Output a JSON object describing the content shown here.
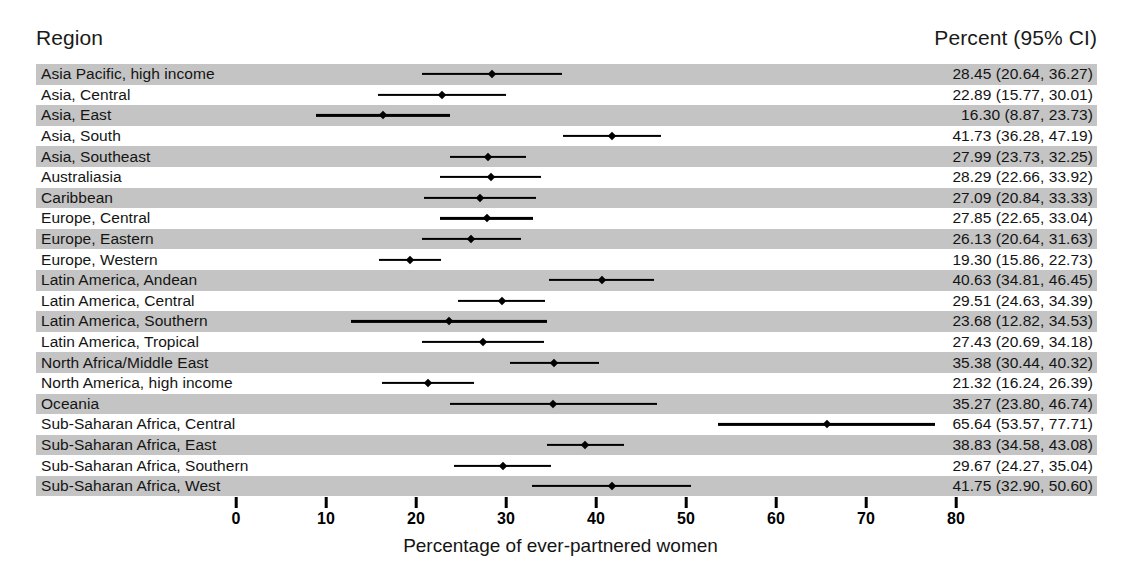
{
  "header": {
    "region_label": "Region",
    "percent_label": "Percent (95% CI)"
  },
  "axis": {
    "title": "Percentage of ever-partnered women",
    "ticks": [
      0,
      10,
      20,
      30,
      40,
      50,
      60,
      70,
      80
    ],
    "min": 0,
    "max": 80,
    "px_at_zero": 236,
    "px_per_unit": 9.0
  },
  "style": {
    "band_color": "#c4c4c4",
    "line_color": "#000000",
    "background": "#ffffff"
  },
  "chart_data": {
    "type": "forest",
    "title": "",
    "xlabel": "Percentage of ever-partnered women",
    "ylabel": "Region",
    "xlim": [
      0,
      80
    ],
    "grid": false,
    "legend": "none",
    "value_header": "Percent (95% CI)",
    "categories": [
      "Asia Pacific, high income",
      "Asia, Central",
      "Asia, East",
      "Asia, South",
      "Asia, Southeast",
      "Australiasia",
      "Caribbean",
      "Europe, Central",
      "Europe, Eastern",
      "Europe, Western",
      "Latin America, Andean",
      "Latin America, Central",
      "Latin America, Southern",
      "Latin America, Tropical",
      "North Africa/Middle East",
      "North America, high income",
      "Oceania",
      "Sub-Saharan Africa, Central",
      "Sub-Saharan Africa, East",
      "Sub-Saharan Africa, Southern",
      "Sub-Saharan Africa, West"
    ],
    "values": [
      28.45,
      22.89,
      16.3,
      41.73,
      27.99,
      28.29,
      27.09,
      27.85,
      26.13,
      19.3,
      40.63,
      29.51,
      23.68,
      27.43,
      35.38,
      21.32,
      35.27,
      65.64,
      38.83,
      29.67,
      41.75
    ],
    "ci_low": [
      20.64,
      15.77,
      8.87,
      36.28,
      23.73,
      22.66,
      20.84,
      22.65,
      20.64,
      15.86,
      34.81,
      24.63,
      12.82,
      20.69,
      30.44,
      16.24,
      23.8,
      53.57,
      34.58,
      24.27,
      32.9
    ],
    "ci_high": [
      36.27,
      30.01,
      23.73,
      47.19,
      32.25,
      33.92,
      33.33,
      33.04,
      31.63,
      22.73,
      46.45,
      34.39,
      34.53,
      34.18,
      40.32,
      26.39,
      46.74,
      77.71,
      43.08,
      35.04,
      50.6
    ]
  },
  "rows": [
    {
      "region": "Asia Pacific, high income",
      "value_text": "28.45 (20.64, 36.27)",
      "est": 28.45,
      "low": 20.64,
      "high": 36.27,
      "banded": true
    },
    {
      "region": "Asia, Central",
      "value_text": "22.89 (15.77, 30.01)",
      "est": 22.89,
      "low": 15.77,
      "high": 30.01,
      "banded": false
    },
    {
      "region": "Asia, East",
      "value_text": "16.30 (8.87, 23.73)",
      "est": 16.3,
      "low": 8.87,
      "high": 23.73,
      "banded": true
    },
    {
      "region": "Asia, South",
      "value_text": "41.73 (36.28, 47.19)",
      "est": 41.73,
      "low": 36.28,
      "high": 47.19,
      "banded": false
    },
    {
      "region": "Asia, Southeast",
      "value_text": "27.99 (23.73, 32.25)",
      "est": 27.99,
      "low": 23.73,
      "high": 32.25,
      "banded": true
    },
    {
      "region": "Australiasia",
      "value_text": "28.29 (22.66, 33.92)",
      "est": 28.29,
      "low": 22.66,
      "high": 33.92,
      "banded": false
    },
    {
      "region": "Caribbean",
      "value_text": "27.09 (20.84, 33.33)",
      "est": 27.09,
      "low": 20.84,
      "high": 33.33,
      "banded": true
    },
    {
      "region": "Europe, Central",
      "value_text": "27.85 (22.65, 33.04)",
      "est": 27.85,
      "low": 22.65,
      "high": 33.04,
      "banded": false
    },
    {
      "region": "Europe, Eastern",
      "value_text": "26.13 (20.64, 31.63)",
      "est": 26.13,
      "low": 20.64,
      "high": 31.63,
      "banded": true
    },
    {
      "region": "Europe, Western",
      "value_text": "19.30 (15.86, 22.73)",
      "est": 19.3,
      "low": 15.86,
      "high": 22.73,
      "banded": false
    },
    {
      "region": "Latin America, Andean",
      "value_text": "40.63 (34.81, 46.45)",
      "est": 40.63,
      "low": 34.81,
      "high": 46.45,
      "banded": true
    },
    {
      "region": "Latin America, Central",
      "value_text": "29.51 (24.63, 34.39)",
      "est": 29.51,
      "low": 24.63,
      "high": 34.39,
      "banded": false
    },
    {
      "region": "Latin America, Southern",
      "value_text": "23.68 (12.82, 34.53)",
      "est": 23.68,
      "low": 12.82,
      "high": 34.53,
      "banded": true
    },
    {
      "region": "Latin America, Tropical",
      "value_text": "27.43 (20.69, 34.18)",
      "est": 27.43,
      "low": 20.69,
      "high": 34.18,
      "banded": false
    },
    {
      "region": "North Africa/Middle East",
      "value_text": "35.38 (30.44, 40.32)",
      "est": 35.38,
      "low": 30.44,
      "high": 40.32,
      "banded": true
    },
    {
      "region": "North America, high income",
      "value_text": "21.32 (16.24, 26.39)",
      "est": 21.32,
      "low": 16.24,
      "high": 26.39,
      "banded": false
    },
    {
      "region": "Oceania",
      "value_text": "35.27 (23.80, 46.74)",
      "est": 35.27,
      "low": 23.8,
      "high": 46.74,
      "banded": true
    },
    {
      "region": "Sub-Saharan Africa, Central",
      "value_text": "65.64 (53.57, 77.71)",
      "est": 65.64,
      "low": 53.57,
      "high": 77.71,
      "banded": false
    },
    {
      "region": "Sub-Saharan Africa, East",
      "value_text": "38.83 (34.58, 43.08)",
      "est": 38.83,
      "low": 34.58,
      "high": 43.08,
      "banded": true
    },
    {
      "region": "Sub-Saharan Africa, Southern",
      "value_text": "29.67 (24.27, 35.04)",
      "est": 29.67,
      "low": 24.27,
      "high": 35.04,
      "banded": false
    },
    {
      "region": "Sub-Saharan Africa, West",
      "value_text": "41.75 (32.90, 50.60)",
      "est": 41.75,
      "low": 32.9,
      "high": 50.6,
      "banded": true
    }
  ]
}
